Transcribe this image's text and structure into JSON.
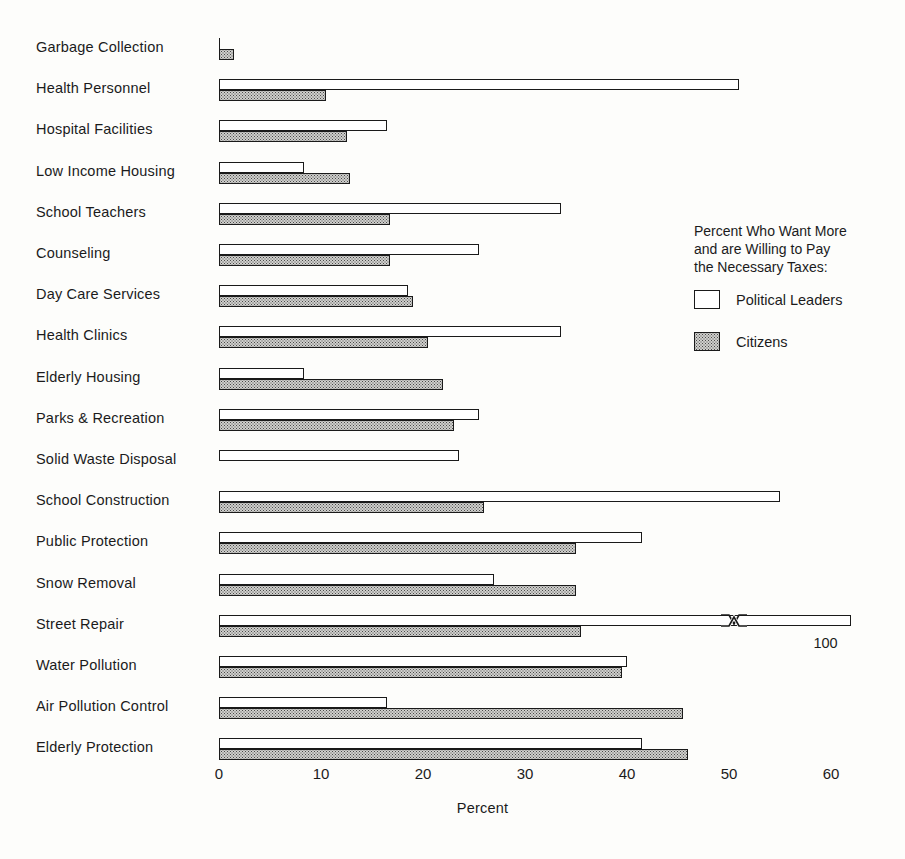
{
  "chart_data": {
    "type": "bar",
    "orientation": "horizontal",
    "title": "",
    "xlabel": "Percent",
    "ylabel": "",
    "xlim": [
      0,
      62
    ],
    "xticks": [
      0,
      10,
      20,
      30,
      40,
      50,
      60
    ],
    "xtick_labels": [
      "0",
      "10",
      "20",
      "30",
      "40",
      "50",
      "60"
    ],
    "grid": false,
    "legend_position": "right",
    "legend_title": "Percent Who Want More\nand are Willing to Pay\nthe Necessary Taxes:",
    "categories": [
      "Garbage Collection",
      "Health Personnel",
      "Hospital Facilities",
      "Low Income Housing",
      "School Teachers",
      "Counseling",
      "Day Care Services",
      "Health Clinics",
      "Elderly Housing",
      "Parks & Recreation",
      "Solid Waste Disposal",
      "School Construction",
      "Public Protection",
      "Snow Removal",
      "Street Repair",
      "Water Pollution",
      "Air Pollution Control",
      "Elderly Protection"
    ],
    "series": [
      {
        "name": "Political Leaders",
        "fill": "white",
        "values": [
          0,
          51,
          16.5,
          8.3,
          33.5,
          25.5,
          18.5,
          33.5,
          8.3,
          25.5,
          23.5,
          55,
          41.5,
          27,
          100,
          40,
          16.5,
          41.5
        ]
      },
      {
        "name": "Citizens",
        "fill": "stipple",
        "values": [
          1.5,
          10.5,
          12.5,
          12.8,
          16.8,
          16.8,
          19,
          20.5,
          22,
          23,
          0,
          26,
          35,
          35,
          35.5,
          39.5,
          45.5,
          46
        ]
      }
    ],
    "annotations": [
      {
        "text": "100",
        "note": "value label at end of broken Street Repair leaders bar",
        "category": "Street Repair"
      }
    ]
  },
  "legend": {
    "title_line1": "Percent Who Want More",
    "title_line2": "and are Willing to Pay",
    "title_line3": "the Necessary Taxes:",
    "items": [
      {
        "label": "Political Leaders",
        "fill": "white"
      },
      {
        "label": "Citizens",
        "fill": "stipple"
      }
    ]
  },
  "axis": {
    "title": "Percent",
    "tick_labels": [
      "0",
      "10",
      "20",
      "30",
      "40",
      "50",
      "60"
    ]
  },
  "colors": {
    "ink": "#1a1a1a",
    "background": "#fdfdfb",
    "stipple_base": "#cfcfcc",
    "stipple_dot": "#4a4a4a"
  }
}
